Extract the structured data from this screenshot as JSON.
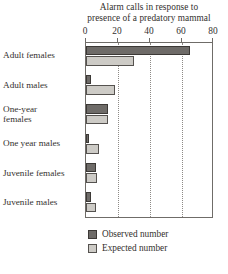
{
  "chart_data": {
    "type": "bar",
    "orientation": "horizontal",
    "title": "Alarm calls in response to presence of a predatory mammal",
    "title_lines": [
      "Alarm calls in response to",
      "presence of a predatory mammal"
    ],
    "xlabel": "",
    "ylabel": "",
    "xlim": [
      0,
      80
    ],
    "ticks": [
      0,
      20,
      40,
      60,
      80
    ],
    "tick_labels": [
      "0",
      "20",
      "40",
      "60",
      "80"
    ],
    "grid": "vertical-dotted",
    "legend_position": "bottom-left",
    "categories": [
      "Adult females",
      "Adult males",
      "One-year females",
      "One year males",
      "Juvenile females",
      "Juvenile males"
    ],
    "category_lines": [
      [
        "Adult females"
      ],
      [
        "Adult males"
      ],
      [
        "One-year",
        "females"
      ],
      [
        "One year males"
      ],
      [
        "Juvenile females"
      ],
      [
        "Juvenile males"
      ]
    ],
    "series": [
      {
        "name": "Observed number",
        "color": "#6e6b68",
        "values": [
          65,
          3,
          14,
          1,
          6,
          3
        ]
      },
      {
        "name": "Expected number",
        "color": "#cdcbc6",
        "values": [
          30,
          18,
          14,
          8,
          7,
          6
        ]
      }
    ]
  },
  "legend": {
    "items": [
      {
        "label": "Observed number",
        "key": "observed"
      },
      {
        "label": "Expected number",
        "key": "expected"
      }
    ]
  }
}
